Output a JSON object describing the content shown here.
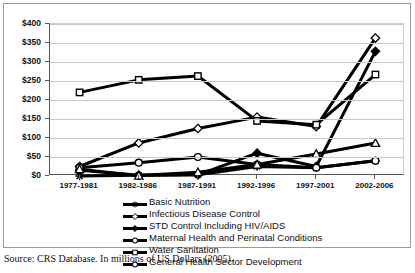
{
  "figure": {
    "source_note": "Source: CRS Database.  In millions of US Dollars (2005)."
  },
  "chart_data": {
    "type": "line",
    "title": "",
    "xlabel": "",
    "ylabel": "",
    "ylim": [
      0,
      400
    ],
    "ytick_step": 50,
    "grid": true,
    "legend_position": "bottom",
    "yticks": [
      "$0",
      "$50",
      "$100",
      "$150",
      "$200",
      "$250",
      "$300",
      "$350",
      "$400"
    ],
    "categories": [
      "1977-1981",
      "1982-1986",
      "1987-1991",
      "1992-1996",
      "1997-2001",
      "2002-2006"
    ],
    "series": [
      {
        "name": "Basic Nutrition",
        "marker": "asterisk",
        "values": [
          0,
          2,
          3,
          25,
          22,
          40
        ]
      },
      {
        "name": "Infectious Disease Control",
        "marker": "open-diamond",
        "values": [
          25,
          87,
          125,
          155,
          130,
          363
        ]
      },
      {
        "name": "STD Control Including HIV/AIDS",
        "marker": "filled-diamond",
        "values": [
          15,
          2,
          3,
          60,
          25,
          328
        ]
      },
      {
        "name": "Maternal Health and Perinatal Conditions",
        "marker": "open-circle",
        "values": [
          22,
          35,
          50,
          30,
          22,
          40
        ]
      },
      {
        "name": "Water Sanitation",
        "marker": "open-square",
        "values": [
          220,
          253,
          263,
          145,
          135,
          267
        ]
      },
      {
        "name": "General Health Sector Development",
        "marker": "open-triangle",
        "values": [
          18,
          1,
          10,
          30,
          58,
          87
        ]
      }
    ]
  },
  "legend": {
    "items": [
      {
        "label": "Basic Nutrition",
        "marker": "asterisk"
      },
      {
        "label": "Infectious Disease Control",
        "marker": "open-diamond"
      },
      {
        "label": "STD Control Including HIV/AIDS",
        "marker": "filled-diamond"
      },
      {
        "label": "Maternal Health and Perinatal Conditions",
        "marker": "open-circle"
      },
      {
        "label": "Water Sanitation",
        "marker": "open-square"
      },
      {
        "label": "General Health Sector Development",
        "marker": "open-circle"
      }
    ]
  },
  "colors": {
    "line": "#000000",
    "marker_fill": "#ffffff",
    "grid": "#c8c8c8",
    "axis": "#555555",
    "frame": "#9a9a9a"
  }
}
